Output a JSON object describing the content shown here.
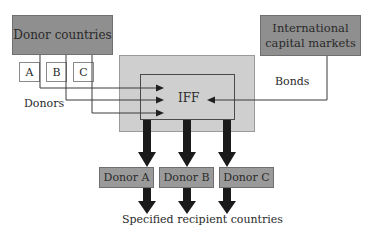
{
  "diagram": {
    "nodes": {
      "donor_countries": "Donor countries",
      "capital_markets_line1": "International",
      "capital_markets_line2": "capital markets",
      "donor_a_small": "A",
      "donor_b_small": "B",
      "donor_c_small": "C",
      "iff": "IFF",
      "donor_a": "Donor A",
      "donor_b": "Donor B",
      "donor_c": "Donor C"
    },
    "labels": {
      "donors": "Donors",
      "bonds": "Bonds",
      "recipients": "Specified recipient countries"
    },
    "edges": [
      {
        "from": "Donor countries (A)",
        "to": "IFF"
      },
      {
        "from": "Donor countries (B)",
        "to": "IFF"
      },
      {
        "from": "Donor countries (C)",
        "to": "IFF"
      },
      {
        "from": "International capital markets",
        "to": "IFF",
        "label": "Bonds"
      },
      {
        "from": "IFF",
        "to": "Donor A"
      },
      {
        "from": "IFF",
        "to": "Donor B"
      },
      {
        "from": "IFF",
        "to": "Donor C"
      },
      {
        "from": "Donor A",
        "to": "Specified recipient countries"
      },
      {
        "from": "Donor B",
        "to": "Specified recipient countries"
      },
      {
        "from": "Donor C",
        "to": "Specified recipient countries"
      }
    ]
  }
}
